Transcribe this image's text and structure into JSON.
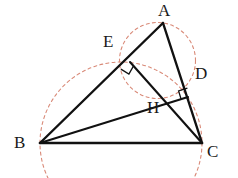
{
  "figure": {
    "background_color": "#ffffff",
    "stroke_color": "#111111",
    "dashed_circle_color": "#d98a78",
    "label_color": "#1a1a1a"
  },
  "labels": {
    "A": "A",
    "B": "B",
    "C": "C",
    "D": "D",
    "E": "E",
    "H": "H"
  },
  "points": {
    "A": {
      "name": "A",
      "x": 163,
      "y": 23
    },
    "B": {
      "name": "B",
      "x": 40,
      "y": 143
    },
    "C": {
      "name": "C",
      "x": 202,
      "y": 143
    },
    "D": {
      "name": "D",
      "x": 188,
      "y": 97
    },
    "E": {
      "name": "E",
      "x": 130,
      "y": 62
    },
    "H": {
      "name": "H",
      "x": 152,
      "y": 98
    }
  },
  "label_positions": {
    "A": {
      "x": 158,
      "y": 2
    },
    "B": {
      "x": 14,
      "y": 136
    },
    "C": {
      "x": 207,
      "y": 143
    },
    "D": {
      "x": 195,
      "y": 66
    },
    "E": {
      "x": 103,
      "y": 34
    },
    "H": {
      "x": 148,
      "y": 100
    }
  },
  "segments": [
    {
      "name": "side-AB",
      "from": "A",
      "to": "B",
      "style": "solid"
    },
    {
      "name": "side-BC",
      "from": "B",
      "to": "C",
      "style": "solid"
    },
    {
      "name": "side-CA",
      "from": "C",
      "to": "A",
      "style": "solid"
    },
    {
      "name": "altitude-BD",
      "from": "B",
      "to": "D",
      "style": "solid"
    },
    {
      "name": "altitude-CE",
      "from": "C",
      "to": "E",
      "style": "solid"
    }
  ],
  "right_angle_marks": [
    {
      "name": "right-angle-at-E",
      "at": "E",
      "size": 9
    },
    {
      "name": "right-angle-at-D",
      "at": "D",
      "size": 9
    }
  ],
  "circles": [
    {
      "name": "circle-diameter-BC",
      "through": [
        "B",
        "E",
        "D",
        "C"
      ],
      "center_x": 121,
      "center_y": 143,
      "radius": 81,
      "style": "dashed"
    },
    {
      "name": "circle-diameter-AH",
      "through": [
        "A",
        "E",
        "D",
        "H"
      ],
      "center_x": 157.5,
      "center_y": 60.5,
      "radius": 38,
      "style": "dashed"
    }
  ]
}
